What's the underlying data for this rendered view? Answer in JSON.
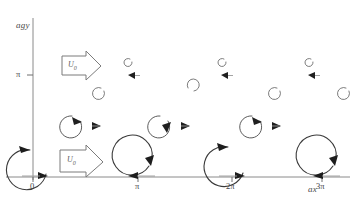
{
  "figure": {
    "background_color": "#ffffff",
    "axes": {
      "y_label": "agy",
      "x_label": "ax",
      "axis_color": "#8a8a8a",
      "origin": {
        "x": 33,
        "y": 177
      },
      "x_ticks": [
        {
          "label": "0",
          "x": 33
        },
        {
          "label": "π",
          "x": 138
        },
        {
          "label": "2π",
          "x": 232
        },
        {
          "label": "3π",
          "x": 322
        }
      ],
      "y_ticks": [
        {
          "label": "π",
          "y": 75
        }
      ]
    },
    "flow_markers": [
      {
        "name": "upper-flow-arrow",
        "label": "U",
        "subscript": "0",
        "x": 60,
        "y": 55,
        "width": 44,
        "height": 26
      },
      {
        "name": "lower-flow-arrow",
        "label": "U",
        "subscript": "0",
        "x": 58,
        "y": 148,
        "width": 48,
        "height": 28
      }
    ],
    "vortex_rows": [
      {
        "name": "baseline-vortex-row",
        "description": "large vortices centred on the x-axis",
        "radius": 21,
        "centers_x": [
          33,
          138,
          232,
          322
        ],
        "center_y": 168,
        "rotation": "counterclockwise"
      },
      {
        "name": "mid-vortex-row",
        "description": "medium C-shaped vortices with rightward advection arrows",
        "radius": 11,
        "centers_x": [
          70,
          158,
          250
        ],
        "center_y": 126,
        "rotation": "counterclockwise"
      },
      {
        "name": "upper-vortex-row",
        "description": "small decaying vortices near y = pi",
        "radius": 6,
        "centers_x": [
          99,
          192,
          275,
          345
        ],
        "center_y": 92,
        "rotation": "counterclockwise"
      },
      {
        "name": "top-vortex-row",
        "description": "smallest residual vortices above y = pi",
        "radius": 4,
        "centers_x": [
          130,
          224,
          310
        ],
        "center_y": 62,
        "rotation": "counterclockwise"
      }
    ],
    "advection_arrows": {
      "name": "advection-arrow-row",
      "color": "#1f1f1f",
      "positions": [
        {
          "x": 95,
          "y": 126
        },
        {
          "x": 185,
          "y": 126
        },
        {
          "x": 275,
          "y": 126
        },
        {
          "x": 133,
          "y": 75
        },
        {
          "x": 226,
          "y": 75
        },
        {
          "x": 313,
          "y": 75
        }
      ]
    }
  }
}
